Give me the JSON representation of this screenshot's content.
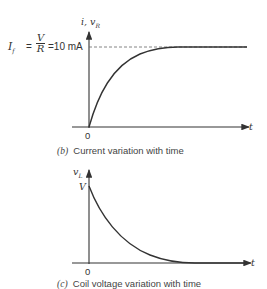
{
  "figure_b": {
    "y_axis_label": "i, v",
    "y_axis_label_sub": "R",
    "x_axis_label": "t",
    "origin_label": "0",
    "final_current": {
      "symbol": "I",
      "symbol_sub": "f",
      "equals": "=",
      "fraction_num": "V",
      "fraction_den": "R",
      "value": "=10 mA"
    },
    "caption_letter": "(b)",
    "caption_text": "Current variation with time"
  },
  "figure_c": {
    "y_axis_label": "v",
    "y_axis_label_sub": "L",
    "y_tick_label": "V",
    "x_axis_label": "t",
    "origin_label": "0",
    "caption_letter": "(c)",
    "caption_text": "Coil voltage variation with time"
  },
  "colors": {
    "line": "#333333",
    "dashed": "#666666",
    "background": "#ffffff"
  }
}
